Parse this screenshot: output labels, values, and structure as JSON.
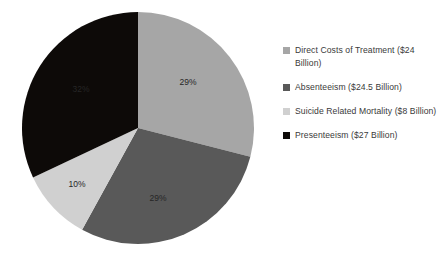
{
  "chart_data": {
    "type": "pie",
    "title": "",
    "subtitle": "",
    "xlabel": "",
    "ylabel": "",
    "grid": false,
    "legend_position": "right",
    "start_angle_deg": 0,
    "direction": "clockwise",
    "center": {
      "x": 138,
      "y": 128
    },
    "radius": 116,
    "categories": [
      "Direct Costs of Treatment ($24 Billion)",
      "Absenteeism ($24.5 Billion)",
      "Suicide Related Mortality ($8 Billion)",
      "Presenteeism ($27 Billion)"
    ],
    "values": [
      29,
      29,
      10,
      32
    ],
    "value_unit": "percent",
    "data_labels": [
      "29%",
      "29%",
      "10%",
      "32%"
    ],
    "amounts_billion_usd": [
      24,
      24.5,
      8,
      27
    ],
    "colors": [
      "#a6a6a6",
      "#595959",
      "#d0d0d0",
      "#0d0a08"
    ],
    "label_text_colors": [
      "#262626",
      "#262626",
      "#262626",
      "#ffffff"
    ],
    "slices": [
      {
        "name": "Direct Costs of Treatment ($24 Billion)",
        "short_name": "Direct Costs of Treatment",
        "amount_label": "$24 Billion",
        "value": 29,
        "data_label": "29%",
        "color": "#a6a6a6",
        "label_color": "#262626",
        "label_x": 188,
        "label_y": 85
      },
      {
        "name": "Absenteeism ($24.5 Billion)",
        "short_name": "Absenteeism",
        "amount_label": "$24.5 Billion",
        "value": 29,
        "data_label": "29%",
        "color": "#595959",
        "label_color": "#262626",
        "label_x": 158,
        "label_y": 201
      },
      {
        "name": "Suicide Related Mortality ($8 Billion)",
        "short_name": "Suicide Related Mortality",
        "amount_label": "$8 Billion",
        "value": 10,
        "data_label": "10%",
        "color": "#d0d0d0",
        "label_color": "#262626",
        "label_x": 77,
        "label_y": 187
      },
      {
        "name": "Presenteeism ($27 Billion)",
        "short_name": "Presenteeism",
        "amount_label": "$27 Billion",
        "value": 32,
        "data_label": "32%",
        "color": "#0d0a08",
        "label_color": "#ffffff",
        "label_x": 81,
        "label_y": 92
      }
    ]
  },
  "legend": {
    "items": [
      {
        "label": "Direct Costs of Treatment ($24 Billion)",
        "color": "#a6a6a6"
      },
      {
        "label": "Absenteeism ($24.5 Billion)",
        "color": "#595959"
      },
      {
        "label": "Suicide Related Mortality ($8 Billion)",
        "color": "#d0d0d0"
      },
      {
        "label": "Presenteeism ($27 Billion)",
        "color": "#0d0a08"
      }
    ]
  }
}
